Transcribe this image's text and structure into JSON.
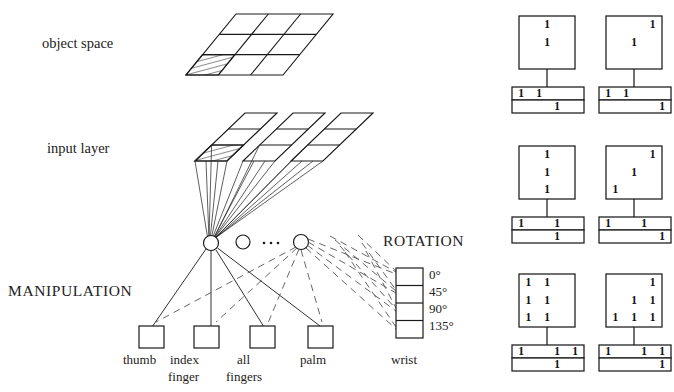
{
  "figure": {
    "background": "#ffffff",
    "ink": "#1a1a1a"
  },
  "left_diagram": {
    "labels": {
      "object_space": "object space",
      "input_layer": "input layer",
      "manipulation": "MANIPULATION",
      "rotation": "ROTATION"
    },
    "object_space": {
      "rows": 3,
      "cols": 3,
      "hatched_cell": "bottom-left"
    },
    "input_layer": {
      "planes": 3,
      "rows": 3,
      "cols": 2,
      "hatched_cell": "bottom-left-of-first-plane"
    },
    "hidden_nodes": {
      "count_visible": 3,
      "ellipsis": "..."
    },
    "output_units": [
      {
        "label_line1": "thumb",
        "label_line2": ""
      },
      {
        "label_line1": "index",
        "label_line2": "finger"
      },
      {
        "label_line1": "all",
        "label_line2": "fingers"
      },
      {
        "label_line1": "palm",
        "label_line2": ""
      }
    ],
    "wrist_unit": {
      "label": "wrist",
      "cells": [
        "0°",
        "45°",
        "90°",
        "135°"
      ]
    }
  },
  "right_panel": {
    "description": "Six example activation patterns: square grid over a two-row bar",
    "examples": [
      {
        "id": "ex-1",
        "grid": {
          "rows": 3,
          "cols": 3,
          "ones": [
            [
              0,
              1
            ],
            [
              1,
              1
            ]
          ]
        },
        "bar_top": {
          "cells": 4,
          "ones": [
            0,
            1
          ]
        },
        "bar_bottom": {
          "cells": 4,
          "ones": [
            2
          ]
        }
      },
      {
        "id": "ex-2",
        "grid": {
          "rows": 3,
          "cols": 3,
          "ones": [
            [
              0,
              2
            ],
            [
              1,
              1
            ]
          ]
        },
        "bar_top": {
          "cells": 4,
          "ones": [
            0,
            1
          ]
        },
        "bar_bottom": {
          "cells": 4,
          "ones": [
            3
          ]
        }
      },
      {
        "id": "ex-3",
        "grid": {
          "rows": 3,
          "cols": 3,
          "ones": [
            [
              0,
              1
            ],
            [
              1,
              1
            ],
            [
              2,
              1
            ]
          ]
        },
        "bar_top": {
          "cells": 4,
          "ones": [
            0,
            2
          ]
        },
        "bar_bottom": {
          "cells": 4,
          "ones": [
            2
          ]
        }
      },
      {
        "id": "ex-4",
        "grid": {
          "rows": 3,
          "cols": 3,
          "ones": [
            [
              0,
              2
            ],
            [
              1,
              1
            ],
            [
              2,
              0
            ]
          ]
        },
        "bar_top": {
          "cells": 4,
          "ones": [
            0,
            2
          ]
        },
        "bar_bottom": {
          "cells": 4,
          "ones": [
            3
          ]
        }
      },
      {
        "id": "ex-5",
        "grid": {
          "rows": 3,
          "cols": 3,
          "ones": [
            [
              0,
              0
            ],
            [
              0,
              1
            ],
            [
              1,
              0
            ],
            [
              1,
              1
            ],
            [
              2,
              0
            ],
            [
              2,
              1
            ]
          ]
        },
        "bar_top": {
          "cells": 4,
          "ones": [
            0,
            2,
            3
          ]
        },
        "bar_bottom": {
          "cells": 4,
          "ones": [
            2
          ]
        }
      },
      {
        "id": "ex-6",
        "grid": {
          "rows": 3,
          "cols": 3,
          "ones": [
            [
              0,
              2
            ],
            [
              1,
              1
            ],
            [
              1,
              2
            ],
            [
              2,
              0
            ],
            [
              2,
              1
            ],
            [
              2,
              2
            ]
          ]
        },
        "bar_top": {
          "cells": 4,
          "ones": [
            0,
            2,
            3
          ]
        },
        "bar_bottom": {
          "cells": 4,
          "ones": [
            3
          ]
        }
      }
    ],
    "digit_symbol": "1"
  }
}
